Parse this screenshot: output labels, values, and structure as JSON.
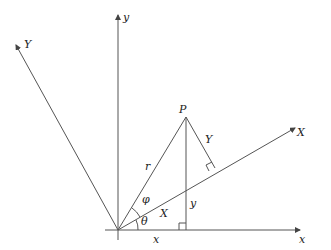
{
  "diagram": {
    "origin": [
      118,
      230
    ],
    "point": {
      "label": "P",
      "pos": [
        186,
        117
      ]
    },
    "axes": {
      "x": {
        "label": "x",
        "end": [
          300,
          230
        ]
      },
      "y": {
        "label": "y",
        "end": [
          118,
          15
        ]
      },
      "X": {
        "label": "X",
        "end": [
          295,
          128
        ]
      },
      "Y": {
        "label": "Y",
        "end": [
          16,
          45
        ]
      }
    },
    "segment_labels": {
      "r": "r",
      "phi": "φ",
      "theta": "θ",
      "X_along": "X",
      "Y_perp": "Y",
      "y_vertical": "y",
      "x_horizontal": "x"
    },
    "colors": {
      "line": "#555555",
      "text": "#222222",
      "background": "#ffffff"
    }
  }
}
